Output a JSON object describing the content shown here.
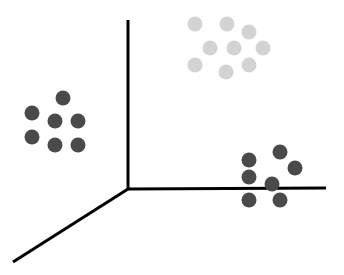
{
  "chart_data": {
    "type": "scatter",
    "title": "",
    "xlabel": "",
    "ylabel": "",
    "zlabel": "",
    "projection": "3d",
    "grid": false,
    "legend": null,
    "axes": {
      "origin": [
        128,
        189
      ],
      "vertical_end": [
        128,
        20
      ],
      "horizontal_end": [
        326,
        188
      ],
      "diagonal_end": [
        13,
        262
      ],
      "stroke": "#000000",
      "stroke_width": 3
    },
    "series": [
      {
        "name": "cluster-left",
        "color": "#4a4a4a",
        "points": [
          [
            63,
            98
          ],
          [
            32,
            113
          ],
          [
            55,
            121
          ],
          [
            78,
            121
          ],
          [
            32,
            137
          ],
          [
            55,
            145
          ],
          [
            78,
            145
          ]
        ]
      },
      {
        "name": "cluster-top",
        "color": "#d3d3d3",
        "points": [
          [
            195,
            24
          ],
          [
            227,
            24
          ],
          [
            249,
            32
          ],
          [
            210,
            48
          ],
          [
            234,
            48
          ],
          [
            263,
            48
          ],
          [
            195,
            65
          ],
          [
            226,
            72
          ],
          [
            249,
            65
          ]
        ]
      },
      {
        "name": "cluster-bottom-right",
        "color": "#4a4a4a",
        "points": [
          [
            280,
            152
          ],
          [
            249,
            160
          ],
          [
            295,
            168
          ],
          [
            249,
            177
          ],
          [
            272,
            184
          ],
          [
            249,
            200
          ],
          [
            280,
            200
          ]
        ]
      }
    ],
    "point_radius": 7.5
  }
}
